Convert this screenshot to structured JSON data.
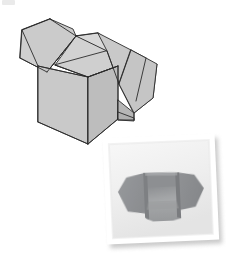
{
  "figure": {
    "background_color": "#ffffff",
    "width": 230,
    "height": 261
  },
  "corner_artifact": {
    "name": "scan-artifact",
    "color": "#d8d8d8"
  },
  "box_diagram": {
    "name": "open-box-line-drawing",
    "description": "Isometric line drawing of an open corrugated box with four outward-folded top flaps",
    "stroke_color": "#2b2b2b",
    "stroke_width": 0.9,
    "fill_front": "#c9c9c9",
    "fill_side": "#bcbcbc",
    "fill_flap_light": "#cfcfcf",
    "fill_flap_mid": "#c4c4c4",
    "fill_interior": "#d6d6d6",
    "fill_interior_dark": "#c0c0c0",
    "fill_bottom_tab": "#b4b4b4",
    "parts": [
      {
        "label": "left-rear-flap"
      },
      {
        "label": "right-rear-flap"
      },
      {
        "label": "front-left-flap"
      },
      {
        "label": "front-right-flap"
      },
      {
        "label": "box-front-face"
      },
      {
        "label": "box-right-face"
      },
      {
        "label": "box-interior"
      },
      {
        "label": "bottom-tab"
      }
    ]
  },
  "photo_inset": {
    "name": "box-photograph",
    "description": "Slightly rotated white-bordered photograph of a real open box seen end-on",
    "rotation_degrees": -2.5,
    "border_color": "#ffffff",
    "paper_color": "#f3f3f3",
    "shadow_color": "#bdbdbd",
    "subject": {
      "description": "Open box with wide folded side flaps, interior visible",
      "fill_left_flap": "#8f9194",
      "fill_right_flap": "#8a8c8f",
      "fill_interior_back": "#9a9c9e",
      "fill_interior_floor": "#a5a7a9",
      "fill_front_panel": "#9fa1a3",
      "fill_rim": "#7c7e81"
    }
  }
}
